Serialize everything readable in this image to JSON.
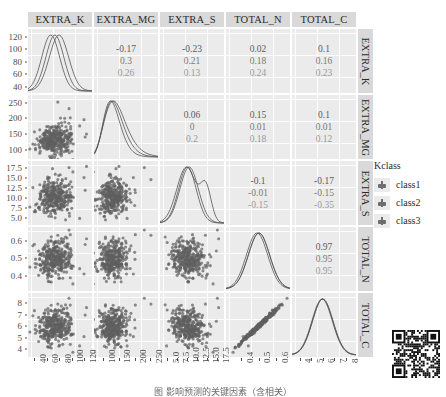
{
  "figure": {
    "type": "scatterplot-matrix",
    "legend_title": "Kclass",
    "caption": "图            影响预测的关键因素（含相关）"
  },
  "chart_data": {
    "type": "scatter",
    "variables": [
      "EXTRA_K",
      "EXTRA_MG",
      "EXTRA_S",
      "TOTAL_N",
      "TOTAL_C"
    ],
    "groups": [
      "class1",
      "class2",
      "class3"
    ],
    "grid": true,
    "legend_position": "right",
    "axis_ranges": {
      "EXTRA_K": [
        35,
        128
      ],
      "EXTRA_MG": [
        80,
        265
      ],
      "EXTRA_S": [
        4.0,
        18.5
      ],
      "TOTAL_N": [
        0.33,
        0.66
      ],
      "TOTAL_C": [
        3.6,
        8.6
      ]
    },
    "ticks": {
      "EXTRA_K": [
        "40",
        "60",
        "80",
        "100",
        "120"
      ],
      "EXTRA_MG": [
        "100",
        "150",
        "200",
        "250"
      ],
      "EXTRA_S": [
        "5.0",
        "7.5",
        "10.0",
        "12.5",
        "15.0",
        "17.5"
      ],
      "TOTAL_N": [
        "0.4",
        "0.5",
        "0.6"
      ],
      "TOTAL_C": [
        "4",
        "5",
        "6",
        "7",
        "8"
      ]
    },
    "correlations": {
      "EXTRA_K__EXTRA_MG": [
        "-0.17",
        "0.3",
        "0.26"
      ],
      "EXTRA_K__EXTRA_S": [
        "-0.23",
        "0.21",
        "0.13"
      ],
      "EXTRA_K__TOTAL_N": [
        "0.02",
        "0.18",
        "0.24"
      ],
      "EXTRA_K__TOTAL_C": [
        "0.1",
        "0.16",
        "0.23"
      ],
      "EXTRA_MG__EXTRA_S": [
        "0.06",
        "0",
        "0.2"
      ],
      "EXTRA_MG__TOTAL_N": [
        "0.15",
        "0.01",
        "0.18"
      ],
      "EXTRA_MG__TOTAL_C": [
        "0.1",
        "0.01",
        "0.12"
      ],
      "EXTRA_S__TOTAL_N": [
        "-0.1",
        "-0.01",
        "-0.15"
      ],
      "EXTRA_S__TOTAL_C": [
        "-0.17",
        "-0.15",
        "-0.35"
      ],
      "TOTAL_N__TOTAL_C": [
        "0.97",
        "0.95",
        "0.95"
      ]
    },
    "diagonal": "density"
  },
  "columns": [
    {
      "id": "EXTRA_K",
      "label": "EXTRA_K"
    },
    {
      "id": "EXTRA_MG",
      "label": "EXTRA_MG"
    },
    {
      "id": "EXTRA_S",
      "label": "EXTRA_S"
    },
    {
      "id": "TOTAL_N",
      "label": "TOTAL_N"
    },
    {
      "id": "TOTAL_C",
      "label": "TOTAL_C"
    }
  ],
  "rows": [
    {
      "id": "EXTRA_K",
      "label": "EXTRA_K"
    },
    {
      "id": "EXTRA_MG",
      "label": "EXTRA_MG"
    },
    {
      "id": "EXTRA_S",
      "label": "EXTRA_S"
    },
    {
      "id": "TOTAL_N",
      "label": "TOTAL_N"
    },
    {
      "id": "TOTAL_C",
      "label": "TOTAL_C"
    }
  ],
  "legend": {
    "title": "Kclass",
    "items": [
      {
        "label": "class1"
      },
      {
        "label": "class2"
      },
      {
        "label": "class3"
      }
    ]
  },
  "colors": {
    "panel_bg": "#ebebeb",
    "strip_bg": "#d9d9d9",
    "grid_major": "#ffffff",
    "point": "#6b6b6b",
    "density_line": "#5a5a5a",
    "text": "#2b2b2b"
  }
}
